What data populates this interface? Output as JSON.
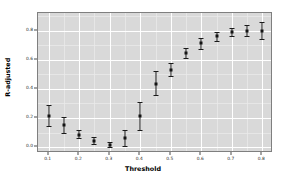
{
  "chart_data": {
    "type": "scatter",
    "title": "",
    "xlabel": "Threshold",
    "ylabel": "R-adjusted",
    "xlim": [
      0.065,
      0.835
    ],
    "ylim": [
      -0.04,
      0.92
    ],
    "grid": true,
    "legend": null,
    "xticks": [
      "0.1",
      "0.2",
      "0.3",
      "0.4",
      "0.5",
      "0.6",
      "0.7",
      "0.8"
    ],
    "xtick_values": [
      0.1,
      0.2,
      0.3,
      0.4,
      0.5,
      0.6,
      0.7,
      0.8
    ],
    "yticks": [
      "0.0",
      "0.2",
      "0.4",
      "0.6",
      "0.8"
    ],
    "ytick_values": [
      0.0,
      0.2,
      0.4,
      0.6,
      0.8
    ],
    "x": [
      0.1,
      0.15,
      0.2,
      0.25,
      0.3,
      0.35,
      0.4,
      0.45,
      0.5,
      0.55,
      0.6,
      0.65,
      0.7,
      0.75,
      0.8
    ],
    "values": [
      0.215,
      0.15,
      0.085,
      0.045,
      0.015,
      0.06,
      0.215,
      0.435,
      0.53,
      0.645,
      0.715,
      0.76,
      0.79,
      0.8,
      0.8
    ],
    "err_low": [
      0.145,
      0.095,
      0.06,
      0.025,
      0.0,
      0.005,
      0.12,
      0.355,
      0.485,
      0.61,
      0.675,
      0.73,
      0.76,
      0.765,
      0.745
    ],
    "err_high": [
      0.29,
      0.21,
      0.115,
      0.07,
      0.035,
      0.115,
      0.31,
      0.52,
      0.58,
      0.68,
      0.75,
      0.79,
      0.82,
      0.84,
      0.86
    ],
    "series": [
      {
        "name": "R-adjusted",
        "values": [
          0.215,
          0.15,
          0.085,
          0.045,
          0.015,
          0.06,
          0.215,
          0.435,
          0.53,
          0.645,
          0.715,
          0.76,
          0.79,
          0.8,
          0.8
        ]
      }
    ],
    "panel_background": "#d9d9d9",
    "gridline_color": "#ffffff",
    "point_color": "#141414"
  }
}
